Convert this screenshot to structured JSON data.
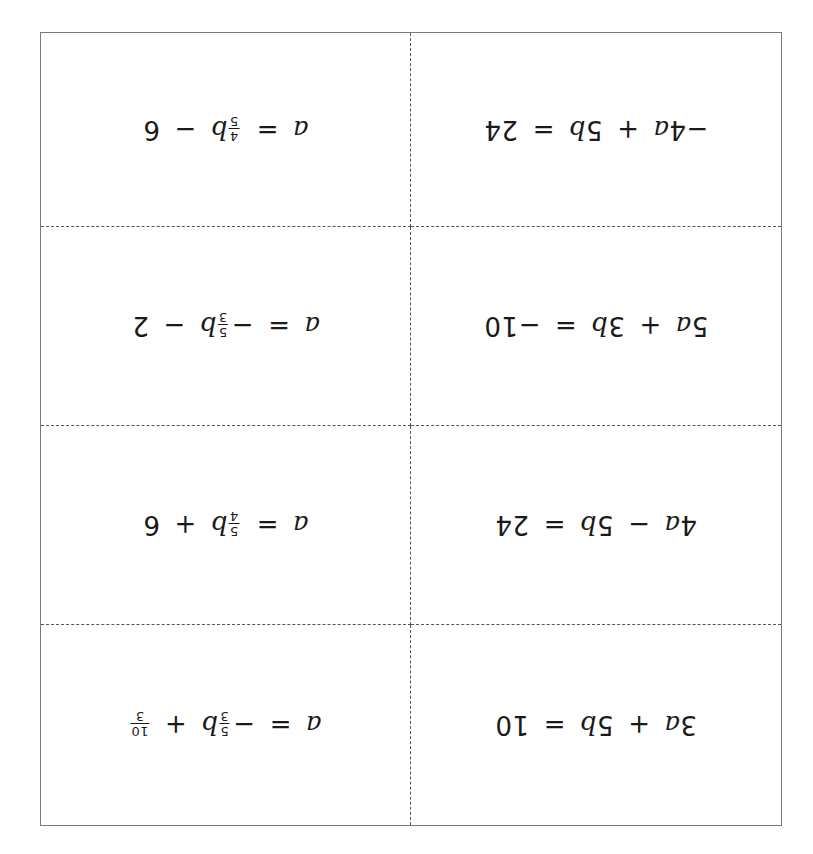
{
  "page": {
    "orientation": "rotated-180",
    "border_color": "#7a7a7a",
    "divider_color": "#555555",
    "background": "#ffffff"
  },
  "cards": [
    {
      "position": "row1-left",
      "text": "a = 4/5 b − 6",
      "lhs": "a",
      "eq": "=",
      "coef_sign": "",
      "coef_num": "4",
      "coef_den": "5",
      "var": "b",
      "op": "−",
      "const": "6",
      "const_is_fraction": false
    },
    {
      "position": "row1-right",
      "text": "−4a + 5b = 24",
      "t1_coef": "−4",
      "t1_var": "a",
      "op": "+",
      "t2_coef": "5",
      "t2_var": "b",
      "eq": "=",
      "rhs": "24"
    },
    {
      "position": "row2-left",
      "text": "a = −5/3 b − 2",
      "lhs": "a",
      "eq": "=",
      "coef_sign": "−",
      "coef_num": "5",
      "coef_den": "3",
      "var": "b",
      "op": "−",
      "const": "2",
      "const_is_fraction": false
    },
    {
      "position": "row2-right",
      "text": "5a + 3b = −10",
      "t1_coef": "5",
      "t1_var": "a",
      "op": "+",
      "t2_coef": "3",
      "t2_var": "b",
      "eq": "=",
      "rhs": "−10"
    },
    {
      "position": "row3-left",
      "text": "a = 5/4 b + 6",
      "lhs": "a",
      "eq": "=",
      "coef_sign": "",
      "coef_num": "5",
      "coef_den": "4",
      "var": "b",
      "op": "+",
      "const": "6",
      "const_is_fraction": false
    },
    {
      "position": "row3-right",
      "text": "4a − 5b = 24",
      "t1_coef": "4",
      "t1_var": "a",
      "op": "−",
      "t2_coef": "5",
      "t2_var": "b",
      "eq": "=",
      "rhs": "24"
    },
    {
      "position": "row4-left",
      "text": "a = −5/3 b + 10/3",
      "lhs": "a",
      "eq": "=",
      "coef_sign": "−",
      "coef_num": "5",
      "coef_den": "3",
      "var": "b",
      "op": "+",
      "const_num": "10",
      "const_den": "3",
      "const_is_fraction": true
    },
    {
      "position": "row4-right",
      "text": "3a + 5b = 10",
      "t1_coef": "3",
      "t1_var": "a",
      "op": "+",
      "t2_coef": "5",
      "t2_var": "b",
      "eq": "=",
      "rhs": "10"
    }
  ]
}
